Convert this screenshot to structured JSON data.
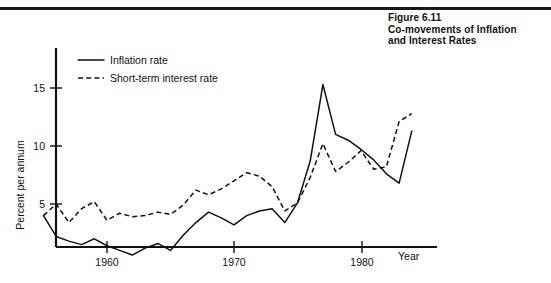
{
  "figure": {
    "number": "Figure 6.11",
    "title_line1": "Co-movements of Inflation",
    "title_line2": "and Interest Rates"
  },
  "legend": {
    "items": [
      {
        "label": "Inflation rate",
        "style": "solid"
      },
      {
        "label": "Short-term interest rate",
        "style": "dashed"
      }
    ]
  },
  "axes": {
    "x_label": "Year",
    "y_label": "Percent per annum",
    "x_ticks": [
      "1960",
      "1970",
      "1980"
    ],
    "y_ticks": [
      "5",
      "10",
      "15"
    ]
  },
  "chart_data": {
    "type": "line",
    "title": "Co-movements of Inflation and Interest Rates",
    "xlabel": "Year",
    "ylabel": "Percent per annum",
    "xlim": [
      1955,
      1984
    ],
    "ylim": [
      0,
      18
    ],
    "grid": false,
    "legend_position": "top-left",
    "x": [
      1955,
      1956,
      1957,
      1958,
      1959,
      1960,
      1961,
      1962,
      1963,
      1964,
      1965,
      1966,
      1967,
      1968,
      1969,
      1970,
      1971,
      1972,
      1973,
      1974,
      1975,
      1976,
      1977,
      1978,
      1979,
      1980,
      1981,
      1982,
      1983,
      1984
    ],
    "series": [
      {
        "name": "Inflation rate",
        "style": "solid",
        "values": [
          4.0,
          2.2,
          1.8,
          1.5,
          2.0,
          1.4,
          1.0,
          0.6,
          1.2,
          1.6,
          1.0,
          2.3,
          3.4,
          4.3,
          3.8,
          3.2,
          4.0,
          4.4,
          4.6,
          3.4,
          5.1,
          8.7,
          15.3,
          11.0,
          10.5,
          9.7,
          8.8,
          7.6,
          6.8,
          11.3
        ]
      },
      {
        "name": "Short-term interest rate",
        "style": "dashed",
        "values": [
          4.0,
          5.0,
          3.4,
          4.6,
          5.2,
          3.6,
          4.2,
          3.9,
          4.0,
          4.3,
          4.1,
          4.9,
          6.2,
          5.8,
          6.3,
          7.0,
          7.7,
          7.4,
          6.5,
          4.4,
          5.1,
          7.3,
          10.2,
          7.8,
          8.6,
          9.6,
          8.0,
          8.2,
          12.1,
          12.8
        ]
      }
    ],
    "annotations": [
      {
        "text": "inflation peak 15.3 in 1974"
      },
      {
        "text": "interest peak 17.8 in 1981"
      }
    ]
  }
}
